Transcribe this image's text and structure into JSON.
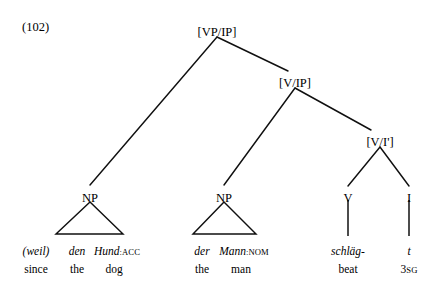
{
  "figure": {
    "example_number": "(102)",
    "background_color": "#ffffff",
    "line_color": "#101010"
  },
  "tree": {
    "nodes": [
      {
        "id": "root",
        "label": "[VP/IP]",
        "x": 217,
        "y": 26
      },
      {
        "id": "vip",
        "label": "[V/IP]",
        "x": 295,
        "y": 77
      },
      {
        "id": "vibar",
        "label": "[V/I']",
        "x": 380,
        "y": 136
      },
      {
        "id": "np1",
        "label": "NP",
        "x": 90,
        "y": 193
      },
      {
        "id": "np2",
        "label": "NP",
        "x": 224,
        "y": 193
      },
      {
        "id": "v",
        "label": "V",
        "x": 348,
        "y": 193
      },
      {
        "id": "i",
        "label": "I",
        "x": 409,
        "y": 193
      }
    ]
  },
  "glosses": {
    "rows": [
      {
        "name": "weil",
        "x": 36,
        "source": "(weil)",
        "source_style": "italic",
        "target": "since",
        "smallcaps": ""
      },
      {
        "name": "den",
        "x": 77,
        "source": "den",
        "source_style": "italic",
        "target": "the",
        "smallcaps": ""
      },
      {
        "name": "hund",
        "x": 117,
        "source": "Hund",
        "source_style": "italic",
        "target": "dog",
        "smallcaps": ":ACC"
      },
      {
        "name": "der",
        "x": 202,
        "source": "der",
        "source_style": "italic",
        "target": "the",
        "smallcaps": ""
      },
      {
        "name": "mann",
        "x": 244,
        "source": "Mann",
        "source_style": "italic",
        "target": "man",
        "smallcaps": ":NOM"
      },
      {
        "name": "schlaeg",
        "x": 348,
        "source": "schläg-",
        "source_style": "italic",
        "target": "beat",
        "smallcaps": ""
      },
      {
        "name": "trace",
        "x": 409,
        "source": "t",
        "source_style": "italic",
        "target": "3",
        "smallcaps": "SG"
      }
    ]
  }
}
